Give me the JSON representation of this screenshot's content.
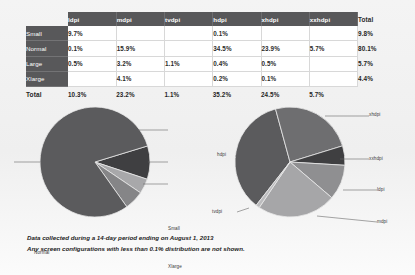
{
  "table": {
    "corner_label": "",
    "column_headers": [
      "ldpi",
      "mdpi",
      "tvdpi",
      "hdpi",
      "xhdpi",
      "xxhdpi"
    ],
    "total_header": "Total",
    "rows": [
      {
        "label": "Small",
        "values": [
          "9.7%",
          "",
          "",
          "0.1%",
          "",
          ""
        ],
        "total": "9.8%"
      },
      {
        "label": "Normal",
        "values": [
          "0.1%",
          "15.9%",
          "",
          "34.5%",
          "23.9%",
          "5.7%"
        ],
        "total": "80.1%"
      },
      {
        "label": "Large",
        "values": [
          "0.5%",
          "3.2%",
          "1.1%",
          "0.4%",
          "0.5%",
          ""
        ],
        "total": "5.7%"
      },
      {
        "label": "Xlarge",
        "values": [
          "",
          "4.1%",
          "",
          "0.2%",
          "0.1%",
          ""
        ],
        "total": "4.4%"
      }
    ],
    "total_row": {
      "label": "Total",
      "values": [
        "10.3%",
        "23.2%",
        "1.1%",
        "35.2%",
        "24.5%",
        "5.7%"
      ],
      "total": ""
    }
  },
  "footer": {
    "line1": "Data collected during a 14-day period ending on August 1, 2013",
    "line2": "Any screen configurations with less than 0.1% distribution are not shown."
  },
  "chart_data": [
    {
      "type": "pie",
      "title": "Screen size distribution",
      "labels": [
        "Normal",
        "Small",
        "Xlarge",
        "Large"
      ],
      "values": [
        80.1,
        9.8,
        4.4,
        5.7
      ],
      "colors": [
        "#5b5b5d",
        "#3f3f41",
        "#a8a8aa",
        "#858587"
      ],
      "legend_position": "callout"
    },
    {
      "type": "pie",
      "title": "Screen density distribution",
      "labels": [
        "hdpi",
        "xhdpi",
        "xxhdpi",
        "ldpi",
        "mdpi",
        "tvdpi"
      ],
      "values": [
        35.2,
        24.5,
        5.7,
        10.3,
        23.2,
        1.1
      ],
      "colors": [
        "#5b5b5d",
        "#6e6e70",
        "#3f3f41",
        "#8f8f91",
        "#a6a6a8",
        "#bcbcbe"
      ],
      "legend_position": "callout"
    }
  ],
  "pie_left": {
    "labels": {
      "normal": "Normal",
      "small": "Small",
      "xlarge": "Xlarge",
      "large": "Large"
    }
  },
  "pie_right": {
    "labels": {
      "xhdpi": "xhdpi",
      "xxhdpi": "xxhdpi",
      "ldpi": "ldpi",
      "mdpi": "mdpi",
      "tvdpi": "tvdpi",
      "hdpi": "hdpi"
    }
  }
}
